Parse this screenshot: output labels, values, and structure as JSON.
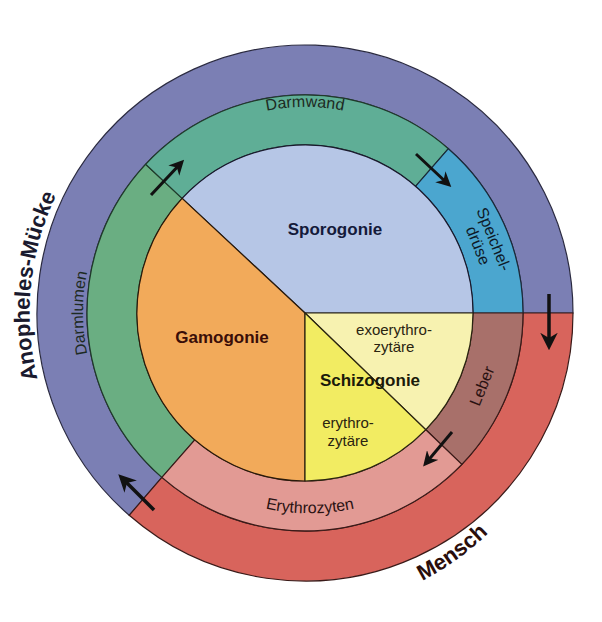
{
  "hosts": {
    "mosquito": {
      "label": "Anopheles-Mücke",
      "color": "#7b7fb4"
    },
    "human": {
      "label": "Mensch",
      "color": "#d8645c"
    }
  },
  "locations": {
    "darmwand": {
      "label": "Darmwand",
      "color": "#5fae96"
    },
    "speicheldruese": {
      "label_line1": "Speichel-",
      "label_line2": "drüse",
      "color": "#4ba6cf"
    },
    "leber": {
      "label": "Leber",
      "color": "#a8706a"
    },
    "erythrozyten": {
      "label": "Erythrozyten",
      "color": "#e29a94"
    },
    "darmlumen": {
      "label": "Darmlumen",
      "color": "#6aae82"
    }
  },
  "phases": {
    "sporogonie": {
      "label": "Sporogonie",
      "color": "#b6c6e6"
    },
    "gamogonie": {
      "label": "Gamogonie",
      "color": "#f2aa5a"
    },
    "schizogonie": {
      "label": "Schizogonie"
    },
    "exoerythrozytaer": {
      "label_line1": "exoerythro-",
      "label_line2": "zytäre",
      "color": "#f7f2b0"
    },
    "erythrozytaer": {
      "label_line1": "erythro-",
      "label_line2": "zytäre",
      "color": "#f2ec62"
    }
  },
  "arrows": [
    {
      "name": "darmlumen-to-darmwand"
    },
    {
      "name": "darmwand-to-speicheldruese"
    },
    {
      "name": "mosquito-to-human"
    },
    {
      "name": "leber-to-erythrozyten"
    },
    {
      "name": "human-to-mosquito"
    }
  ]
}
